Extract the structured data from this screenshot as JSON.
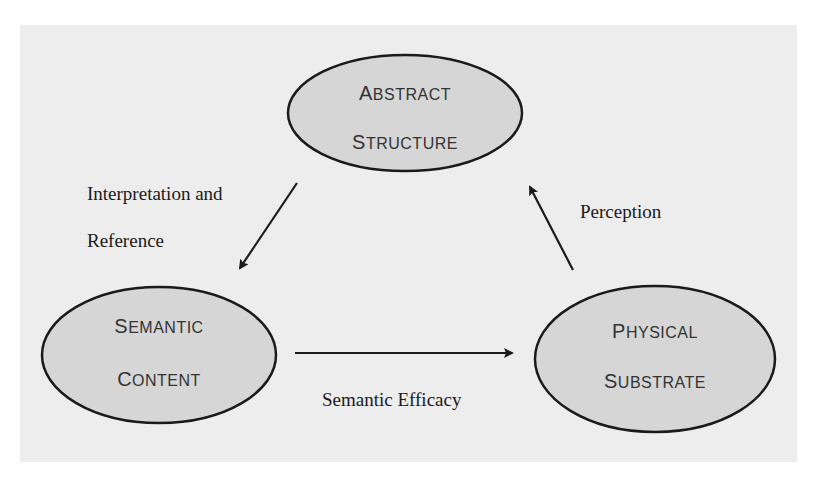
{
  "diagram": {
    "background_color": "#ededed",
    "node_fill": "#d6d6d6",
    "stroke_color": "#1a1a1a",
    "nodes": [
      {
        "id": "abstract",
        "line1_cap": "A",
        "line1_rest": "BSTRACT",
        "line2_cap": "S",
        "line2_rest": "TRUCTURE",
        "label": "Abstract Structure"
      },
      {
        "id": "semantic",
        "line1_cap": "S",
        "line1_rest": "EMANTIC",
        "line2_cap": "C",
        "line2_rest": "ONTENT",
        "label": "Semantic Content"
      },
      {
        "id": "physical",
        "line1_cap": "P",
        "line1_rest": "HYSICAL",
        "line2_cap": "S",
        "line2_rest": "UBSTRATE",
        "label": "Physical Substrate"
      }
    ],
    "edges": [
      {
        "from": "abstract",
        "to": "semantic",
        "label_line1": "Interpretation and",
        "label_line2": "Reference"
      },
      {
        "from": "physical",
        "to": "abstract",
        "label": "Perception"
      },
      {
        "from": "semantic",
        "to": "physical",
        "label": "Semantic Efficacy"
      }
    ]
  }
}
